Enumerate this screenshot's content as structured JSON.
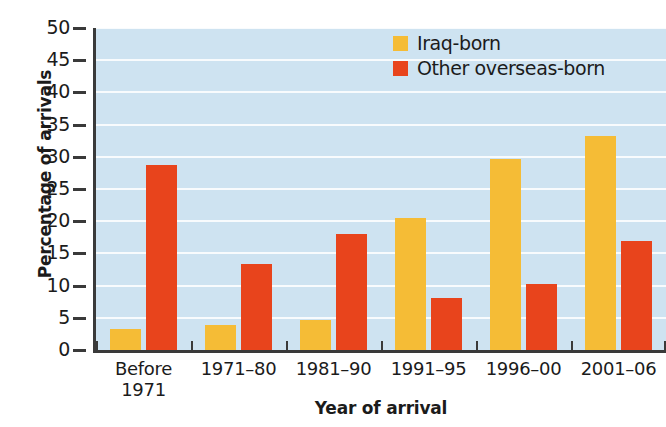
{
  "chart_data": {
    "type": "bar",
    "title": "",
    "xlabel": "Year of arrival",
    "ylabel": "Percentage of arrivals",
    "categories": [
      "Before 1971",
      "1971–80",
      "1981–90",
      "1991–95",
      "1996–00",
      "2001–06"
    ],
    "category_lines": [
      [
        "Before",
        "1971"
      ],
      [
        "1971–80"
      ],
      [
        "1981–90"
      ],
      [
        "1991–95"
      ],
      [
        "1996–00"
      ],
      [
        "2001–06"
      ]
    ],
    "series": [
      {
        "name": "Iraq-born",
        "color": "#f5bc36",
        "values": [
          3.3,
          3.9,
          4.7,
          20.5,
          29.7,
          33.3
        ]
      },
      {
        "name": "Other overseas-born",
        "color": "#e8441c",
        "values": [
          28.7,
          13.3,
          18.0,
          8.0,
          10.2,
          16.9
        ]
      }
    ],
    "ylim": [
      0,
      50
    ],
    "ytick_values": [
      0,
      5,
      10,
      15,
      20,
      25,
      30,
      35,
      40,
      45,
      50
    ],
    "ytick_labels": [
      "0",
      "5",
      "10",
      "15",
      "20",
      "25",
      "30",
      "35",
      "40",
      "45",
      "50"
    ],
    "grid": true,
    "grid_axis": "y",
    "legend_position": "top-right",
    "plot_background": "#cee3f1",
    "axis_color": "#3a3a3a"
  },
  "legend": {
    "items": [
      {
        "label": "Iraq-born",
        "color": "#f5bc36"
      },
      {
        "label": "Other overseas-born",
        "color": "#e8441c"
      }
    ]
  }
}
